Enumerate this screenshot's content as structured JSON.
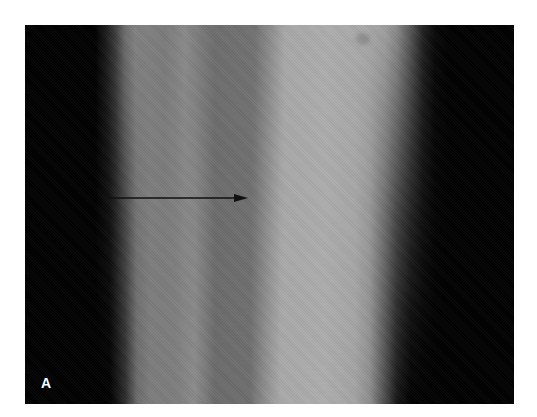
{
  "figure": {
    "type": "radiograph",
    "panel_label": "A",
    "annotation": {
      "type": "arrow",
      "direction": "right",
      "color": "#111111"
    },
    "colors": {
      "background": "#ffffff",
      "soft_tissue_dark": "#000000",
      "bone_mid_gray": "#7a7a7a",
      "bone_bright": "#acacac",
      "label": "#ffffff"
    }
  }
}
